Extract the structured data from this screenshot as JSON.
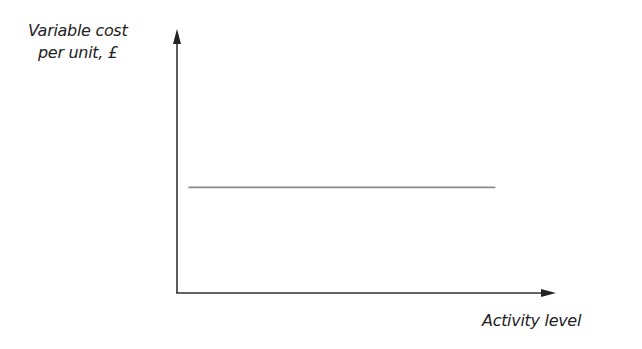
{
  "chart_data": {
    "type": "line",
    "title": "",
    "xlabel": "Activity level",
    "ylabel": "Variable cost per unit, £",
    "ylabel_lines": [
      "Variable cost",
      "per unit, £"
    ],
    "x_ticks": [],
    "y_ticks": [],
    "grid": false,
    "legend": null,
    "series": [
      {
        "name": "Variable cost per unit",
        "description": "Constant (horizontal) line — variable cost per unit stays the same at all activity levels",
        "x": [
          0.03,
          0.84
        ],
        "y": [
          0.4,
          0.4
        ],
        "color": "#8a8a8a"
      }
    ],
    "xlim": [
      0,
      1
    ],
    "ylim": [
      0,
      1
    ],
    "axis_color": "#333333"
  }
}
